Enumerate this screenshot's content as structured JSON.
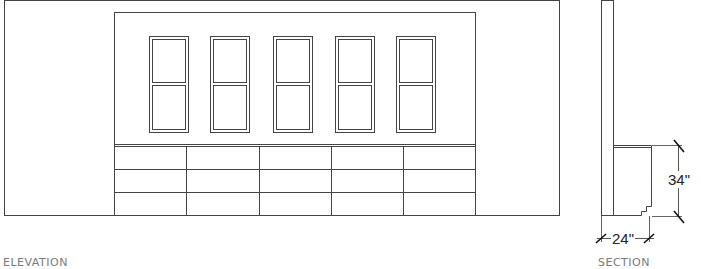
{
  "drawing": {
    "elevation_label": "ELEVATION",
    "section_label": "SECTION",
    "dimensions": {
      "height": "34\"",
      "depth": "24\""
    },
    "window_count": 5,
    "drawer_columns": 5,
    "drawer_rows": 3,
    "line_color": "#333333"
  }
}
